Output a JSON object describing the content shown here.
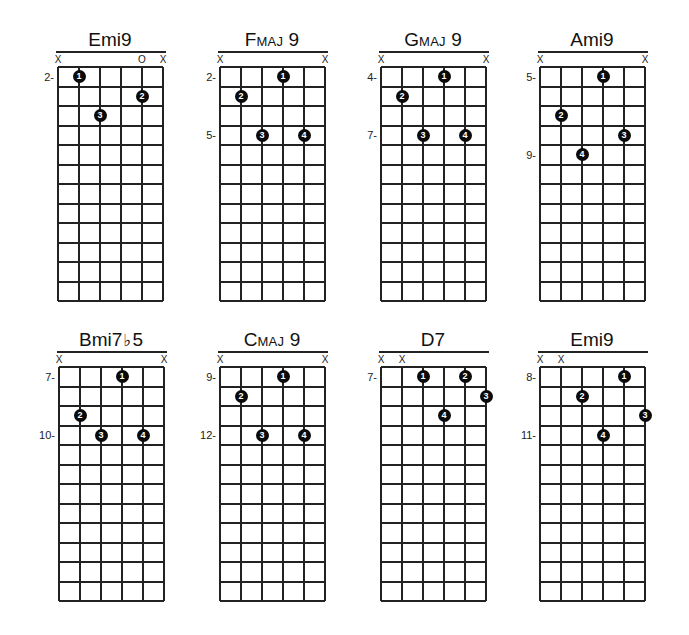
{
  "grid": {
    "strings": 6,
    "frets": 12
  },
  "chords": [
    {
      "name": "Emi9",
      "name_main": "Emi9",
      "name_sc": "",
      "name_tail": "",
      "markers": [
        {
          "string": 0,
          "symbol": "X"
        },
        {
          "string": 4,
          "symbol": "O"
        },
        {
          "string": 5,
          "symbol": "X"
        }
      ],
      "fret_labels": [
        {
          "row": 1,
          "text": "2-"
        }
      ],
      "fingers": [
        {
          "string": 1,
          "row": 1,
          "finger": "1"
        },
        {
          "string": 4,
          "row": 2,
          "finger": "2"
        },
        {
          "string": 2,
          "row": 3,
          "finger": "3"
        }
      ]
    },
    {
      "name": "Fmaj 9",
      "name_main": "F",
      "name_sc": "MAJ",
      "name_tail": " 9",
      "markers": [
        {
          "string": 0,
          "symbol": "X"
        },
        {
          "string": 5,
          "symbol": "X"
        }
      ],
      "fret_labels": [
        {
          "row": 1,
          "text": "2-"
        },
        {
          "row": 4,
          "text": "5-"
        }
      ],
      "fingers": [
        {
          "string": 3,
          "row": 1,
          "finger": "1"
        },
        {
          "string": 1,
          "row": 2,
          "finger": "2"
        },
        {
          "string": 2,
          "row": 4,
          "finger": "3"
        },
        {
          "string": 4,
          "row": 4,
          "finger": "4"
        }
      ]
    },
    {
      "name": "Gmaj 9",
      "name_main": "G",
      "name_sc": "MAJ",
      "name_tail": " 9",
      "markers": [
        {
          "string": 0,
          "symbol": "X"
        },
        {
          "string": 5,
          "symbol": "X"
        }
      ],
      "fret_labels": [
        {
          "row": 1,
          "text": "4-"
        },
        {
          "row": 4,
          "text": "7-"
        }
      ],
      "fingers": [
        {
          "string": 3,
          "row": 1,
          "finger": "1"
        },
        {
          "string": 1,
          "row": 2,
          "finger": "2"
        },
        {
          "string": 2,
          "row": 4,
          "finger": "3"
        },
        {
          "string": 4,
          "row": 4,
          "finger": "4"
        }
      ]
    },
    {
      "name": "Ami9",
      "name_main": "Ami9",
      "name_sc": "",
      "name_tail": "",
      "markers": [
        {
          "string": 0,
          "symbol": "X"
        },
        {
          "string": 5,
          "symbol": "X"
        }
      ],
      "fret_labels": [
        {
          "row": 1,
          "text": "5-"
        },
        {
          "row": 5,
          "text": "9-"
        }
      ],
      "fingers": [
        {
          "string": 3,
          "row": 1,
          "finger": "1"
        },
        {
          "string": 1,
          "row": 3,
          "finger": "2"
        },
        {
          "string": 4,
          "row": 4,
          "finger": "3"
        },
        {
          "string": 2,
          "row": 5,
          "finger": "4"
        }
      ]
    },
    {
      "name": "Bmi7♭5",
      "name_main": "Bmi7",
      "name_sc": "",
      "name_flat": "♭",
      "name_tail": "5",
      "markers": [
        {
          "string": 0,
          "symbol": "X"
        },
        {
          "string": 5,
          "symbol": "X"
        }
      ],
      "fret_labels": [
        {
          "row": 1,
          "text": "7-"
        },
        {
          "row": 4,
          "text": "10-"
        }
      ],
      "fingers": [
        {
          "string": 3,
          "row": 1,
          "finger": "1"
        },
        {
          "string": 1,
          "row": 3,
          "finger": "2"
        },
        {
          "string": 2,
          "row": 4,
          "finger": "3"
        },
        {
          "string": 4,
          "row": 4,
          "finger": "4"
        }
      ]
    },
    {
      "name": "Cmaj 9",
      "name_main": "C",
      "name_sc": "MAJ",
      "name_tail": " 9",
      "markers": [
        {
          "string": 0,
          "symbol": "X"
        },
        {
          "string": 5,
          "symbol": "X"
        }
      ],
      "fret_labels": [
        {
          "row": 1,
          "text": "9-"
        },
        {
          "row": 4,
          "text": "12-"
        }
      ],
      "fingers": [
        {
          "string": 3,
          "row": 1,
          "finger": "1"
        },
        {
          "string": 1,
          "row": 2,
          "finger": "2"
        },
        {
          "string": 2,
          "row": 4,
          "finger": "3"
        },
        {
          "string": 4,
          "row": 4,
          "finger": "4"
        }
      ]
    },
    {
      "name": "D7",
      "name_main": "D7",
      "name_sc": "",
      "name_tail": "",
      "markers": [
        {
          "string": 0,
          "symbol": "X"
        },
        {
          "string": 1,
          "symbol": "X"
        }
      ],
      "fret_labels": [
        {
          "row": 1,
          "text": "7-"
        }
      ],
      "fingers": [
        {
          "string": 2,
          "row": 1,
          "finger": "1"
        },
        {
          "string": 4,
          "row": 1,
          "finger": "2"
        },
        {
          "string": 5,
          "row": 2,
          "finger": "3"
        },
        {
          "string": 3,
          "row": 3,
          "finger": "4"
        }
      ]
    },
    {
      "name": "Emi9",
      "name_main": "Emi9",
      "name_sc": "",
      "name_tail": "",
      "markers": [
        {
          "string": 0,
          "symbol": "X"
        },
        {
          "string": 1,
          "symbol": "X"
        }
      ],
      "fret_labels": [
        {
          "row": 1,
          "text": "8-"
        },
        {
          "row": 4,
          "text": "11-"
        }
      ],
      "fingers": [
        {
          "string": 4,
          "row": 1,
          "finger": "1"
        },
        {
          "string": 2,
          "row": 2,
          "finger": "2"
        },
        {
          "string": 5,
          "row": 3,
          "finger": "3"
        },
        {
          "string": 3,
          "row": 4,
          "finger": "4"
        }
      ]
    }
  ]
}
